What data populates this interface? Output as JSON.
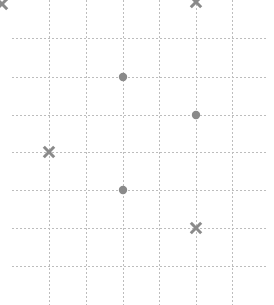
{
  "canvas": {
    "width": 274,
    "height": 305,
    "background": "#ffffff"
  },
  "grid": {
    "line_color": "#bdbdbd",
    "line_width": 1,
    "dash_pattern": "2,2",
    "style": "dashed",
    "vertical_lines_x": [
      49,
      86,
      123,
      159,
      196,
      232
    ],
    "horizontal_lines_y": [
      38,
      77,
      115,
      152,
      190,
      228,
      266
    ],
    "horizontal_extent_x": [
      12,
      267
    ],
    "vertical_extent_y": [
      0,
      305
    ],
    "spacing_x": 37,
    "spacing_y": 38
  },
  "chart_data": {
    "type": "scatter",
    "title": "",
    "subtitle": "",
    "xlabel": "",
    "ylabel": "",
    "grid": true,
    "legend": "none",
    "xlim": [
      12,
      267
    ],
    "ylim": [
      0,
      305
    ],
    "marker_color": "#8a8a8a",
    "series": [
      {
        "name": "circle-series",
        "marker": "circle",
        "color": "#8a8a8a",
        "points": [
          {
            "x": 123,
            "y": 77,
            "clipped": false
          },
          {
            "x": 196,
            "y": 115,
            "clipped": false
          },
          {
            "x": 123,
            "y": 190,
            "clipped": false
          }
        ]
      },
      {
        "name": "cross-series",
        "marker": "x",
        "color": "#8a8a8a",
        "points": [
          {
            "x": 196,
            "y": 2,
            "clipped": true
          },
          {
            "x": 49,
            "y": 152,
            "clipped": false
          },
          {
            "x": 196,
            "y": 228,
            "clipped": false
          },
          {
            "x": 2,
            "y": 4,
            "clipped": true
          }
        ]
      }
    ]
  }
}
